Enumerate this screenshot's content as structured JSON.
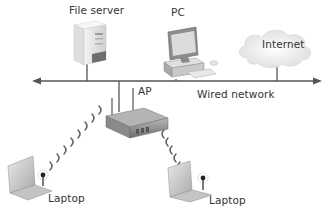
{
  "diagram": {
    "type": "network-topology",
    "nodes": {
      "file_server": {
        "label": "File server",
        "icon": "server-tower-icon"
      },
      "pc": {
        "label": "PC",
        "icon": "desktop-computer-icon"
      },
      "internet": {
        "label": "Internet",
        "icon": "cloud-icon"
      },
      "ap": {
        "label": "AP",
        "icon": "wireless-access-point-icon"
      },
      "laptop_left": {
        "label": "Laptop",
        "icon": "laptop-icon"
      },
      "laptop_right": {
        "label": "Laptop",
        "icon": "laptop-icon"
      }
    },
    "backbone": {
      "label": "Wired network",
      "style": "double-arrow line"
    },
    "edges": [
      {
        "from": "file_server",
        "to": "backbone",
        "type": "wired"
      },
      {
        "from": "pc",
        "to": "backbone",
        "type": "wired"
      },
      {
        "from": "internet",
        "to": "backbone",
        "type": "wired"
      },
      {
        "from": "ap",
        "to": "backbone",
        "type": "wired"
      },
      {
        "from": "ap",
        "to": "laptop_left",
        "type": "wireless"
      },
      {
        "from": "ap",
        "to": "laptop_right",
        "type": "wireless"
      }
    ],
    "colors": {
      "line": "#555555",
      "text": "#333333",
      "device_light": "#e6e6e6",
      "device_dark": "#8a8a8a",
      "cloud": "#f0f0f0"
    }
  }
}
